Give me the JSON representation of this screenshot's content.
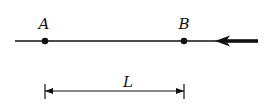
{
  "diagram": {
    "points": [
      {
        "label": "A"
      },
      {
        "label": "B"
      }
    ],
    "dimension_label": "L",
    "colors": {
      "ink": "#111111",
      "background": "#ffffff"
    }
  }
}
